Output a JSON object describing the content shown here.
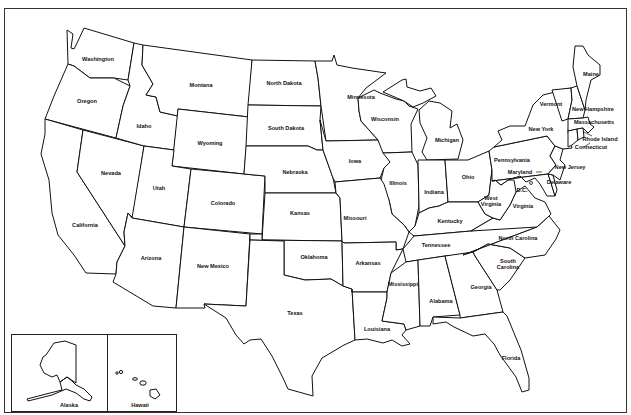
{
  "map": {
    "title": "United States Map",
    "states": [
      {
        "id": "WA",
        "name": "Washington",
        "x": 98,
        "y": 59
      },
      {
        "id": "OR",
        "name": "Oregon",
        "x": 87,
        "y": 101
      },
      {
        "id": "ID",
        "name": "Idaho",
        "x": 144,
        "y": 126
      },
      {
        "id": "MT",
        "name": "Montana",
        "x": 201,
        "y": 85
      },
      {
        "id": "WY",
        "name": "Wyoming",
        "x": 210,
        "y": 143
      },
      {
        "id": "ND",
        "name": "North Dakota",
        "x": 284,
        "y": 83
      },
      {
        "id": "SD",
        "name": "South Dakota",
        "x": 286,
        "y": 128
      },
      {
        "id": "NE",
        "name": "Nebraska",
        "x": 295,
        "y": 172
      },
      {
        "id": "MN",
        "name": "Minnesota",
        "x": 361,
        "y": 97
      },
      {
        "id": "WI",
        "name": "Wisconsin",
        "x": 385,
        "y": 119
      },
      {
        "id": "MI",
        "name": "Michigan",
        "x": 447,
        "y": 140
      },
      {
        "id": "IA",
        "name": "Iowa",
        "x": 355,
        "y": 161
      },
      {
        "id": "IL",
        "name": "Illinois",
        "x": 398,
        "y": 183
      },
      {
        "id": "IN",
        "name": "Indiana",
        "x": 434,
        "y": 192
      },
      {
        "id": "OH",
        "name": "Ohio",
        "x": 468,
        "y": 177
      },
      {
        "id": "NV",
        "name": "Nevada",
        "x": 111,
        "y": 173
      },
      {
        "id": "UT",
        "name": "Utah",
        "x": 159,
        "y": 188
      },
      {
        "id": "CO",
        "name": "Colorado",
        "x": 223,
        "y": 203
      },
      {
        "id": "KS",
        "name": "Kansas",
        "x": 300,
        "y": 213
      },
      {
        "id": "MO",
        "name": "Missouri",
        "x": 355,
        "y": 218
      },
      {
        "id": "CA",
        "name": "California",
        "x": 85,
        "y": 225
      },
      {
        "id": "AZ",
        "name": "Arizona",
        "x": 151,
        "y": 258
      },
      {
        "id": "NM",
        "name": "New Mexico",
        "x": 213,
        "y": 266
      },
      {
        "id": "OK",
        "name": "Oklahoma",
        "x": 314,
        "y": 257
      },
      {
        "id": "TX",
        "name": "Texas",
        "x": 295,
        "y": 313
      },
      {
        "id": "AR",
        "name": "Arkansas",
        "x": 368,
        "y": 263
      },
      {
        "id": "LA",
        "name": "Louisiana",
        "x": 377,
        "y": 329
      },
      {
        "id": "MS",
        "name": "Mississippi",
        "x": 403,
        "y": 284
      },
      {
        "id": "AL",
        "name": "Alabama",
        "x": 441,
        "y": 301
      },
      {
        "id": "GA",
        "name": "Georgia",
        "x": 481,
        "y": 287
      },
      {
        "id": "FL",
        "name": "Florida",
        "x": 511,
        "y": 358
      },
      {
        "id": "TN",
        "name": "Tennessee",
        "x": 436,
        "y": 245
      },
      {
        "id": "KY",
        "name": "Kentucky",
        "x": 450,
        "y": 221
      },
      {
        "id": "SC",
        "name": "South\nCarolina",
        "x": 508,
        "y": 264
      },
      {
        "id": "NC",
        "name": "North Carolina",
        "x": 518,
        "y": 238
      },
      {
        "id": "VA",
        "name": "Virginia",
        "x": 523,
        "y": 206
      },
      {
        "id": "WV",
        "name": "West\nVirginia",
        "x": 491,
        "y": 201
      },
      {
        "id": "PA",
        "name": "Pennsylvania",
        "x": 512,
        "y": 160
      },
      {
        "id": "MD",
        "name": "Maryland",
        "x": 520,
        "y": 172
      },
      {
        "id": "DC",
        "name": "D.C.",
        "x": 522,
        "y": 190
      },
      {
        "id": "DE",
        "name": "Delaware",
        "x": 559,
        "y": 182
      },
      {
        "id": "NJ",
        "name": "New Jersey",
        "x": 570,
        "y": 167
      },
      {
        "id": "NY",
        "name": "New York",
        "x": 541,
        "y": 129
      },
      {
        "id": "VT",
        "name": "Vermont",
        "x": 551,
        "y": 104
      },
      {
        "id": "NH",
        "name": "New Hampshire",
        "x": 593,
        "y": 109
      },
      {
        "id": "ME",
        "name": "Maine",
        "x": 591,
        "y": 74
      },
      {
        "id": "MA",
        "name": "Massachusetts",
        "x": 594,
        "y": 122
      },
      {
        "id": "RI",
        "name": "Rhode Island",
        "x": 600,
        "y": 139
      },
      {
        "id": "CT",
        "name": "Connecticut",
        "x": 591,
        "y": 147
      }
    ],
    "insets": {
      "alaska": "Alaska",
      "hawaii": "Hawaii"
    }
  }
}
